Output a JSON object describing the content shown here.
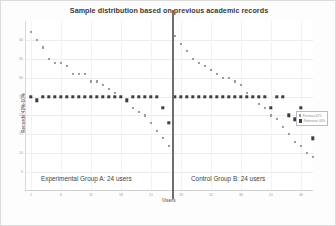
{
  "chart_data": {
    "type": "scatter",
    "title": "Sample distribution based on previous academic records",
    "xlabel": "Users",
    "ylabel": "Records 42%-10%",
    "xlim": [
      0,
      48
    ],
    "ylim": [
      0,
      45
    ],
    "xticks": [
      1,
      6,
      11,
      16,
      21,
      26,
      31,
      36,
      41,
      46
    ],
    "yticks": [
      5,
      10,
      15,
      20,
      25,
      30,
      35,
      40
    ],
    "grid": true,
    "legend_position": "right-inside",
    "series": [
      {
        "name": "Previous 42%",
        "color": "#9a9a9a",
        "marker": "small-square",
        "x": [
          1,
          2,
          3,
          4,
          5,
          6,
          7,
          8,
          9,
          10,
          11,
          12,
          13,
          14,
          15,
          16,
          17,
          18,
          19,
          20,
          21,
          22,
          23,
          24,
          25,
          26,
          27,
          28,
          29,
          30,
          31,
          32,
          33,
          34,
          35,
          36,
          37,
          38,
          39,
          40,
          41,
          42,
          43,
          44,
          45,
          46,
          47,
          48
        ],
        "y": [
          42,
          40,
          38,
          35,
          34,
          34,
          33,
          31,
          31,
          31,
          29,
          29,
          28,
          27,
          26,
          25,
          24,
          22,
          21,
          20,
          18,
          16,
          14,
          12,
          41,
          39,
          37,
          35,
          34,
          33,
          32,
          31,
          30,
          30,
          29,
          28,
          26,
          25,
          23,
          22,
          20,
          19,
          17,
          15,
          13,
          12,
          10,
          9
        ]
      },
      {
        "name": "Reference 40%",
        "color": "#3d3d3d",
        "marker": "square",
        "x": [
          1,
          2,
          3,
          4,
          5,
          6,
          7,
          8,
          9,
          10,
          11,
          12,
          13,
          14,
          15,
          16,
          17,
          18,
          19,
          20,
          21,
          22,
          23,
          24,
          25,
          26,
          27,
          28,
          29,
          30,
          31,
          32,
          33,
          34,
          35,
          36,
          37,
          38,
          39,
          40,
          41,
          42,
          43,
          44,
          45,
          46,
          47,
          48
        ],
        "y": [
          25,
          24,
          25,
          25,
          25,
          25,
          25,
          25,
          25,
          25,
          25,
          25,
          25,
          25,
          25,
          25,
          24,
          25,
          25,
          25,
          25,
          25,
          22,
          18,
          25,
          25,
          25,
          25,
          25,
          25,
          25,
          25,
          25,
          25,
          25,
          25,
          25,
          25,
          25,
          25,
          22,
          25,
          25,
          20,
          19,
          22,
          18,
          14
        ]
      }
    ],
    "annotations": [
      {
        "id": "group-a",
        "text": "Experimental Group A: 24 users"
      },
      {
        "id": "group-b",
        "text": "Control Group B: 24 users"
      }
    ],
    "divider": {
      "x": 24.5,
      "label": "group-separator"
    }
  },
  "legend": {
    "items": [
      {
        "label": "Previous 42%",
        "marker": "normal"
      },
      {
        "label": "Reference 40%",
        "marker": "reference"
      }
    ]
  }
}
